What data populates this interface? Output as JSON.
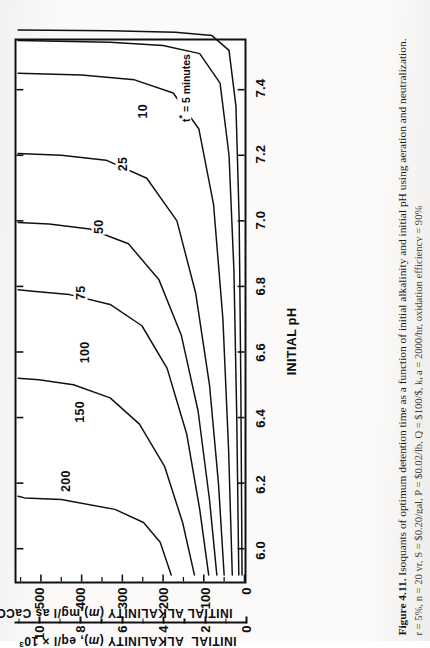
{
  "figure": {
    "number": "Figure 4.11.",
    "caption_line1": "Isoquants of optimum detention time as a function of initial alkalinity and initial pH using aeration and neutralization.",
    "caption_line2_prefix": "r = 5%, n = 20 yr, S = $0.20/gal, P = $0.02/lb, Q = $100/$, k",
    "caption_line2_sub": "L",
    "caption_line2_mid": "a = 2000/hr, oxidation efficiency = 90%"
  },
  "chart_data": {
    "type": "line",
    "title": "Isoquants of optimum detention time as a function of initial alkalinity and initial pH using aeration and neutralization.",
    "xlabel": "INITIAL pH",
    "ylabel": "INITIAL ALKALINITY (m),mg/l as CaCO3",
    "ylabel2": "INITIAL ALKALINITY (m), eq/l x 10^3",
    "xlim": [
      5.9,
      7.55
    ],
    "ylim": [
      0,
      560
    ],
    "ylim2": [
      0,
      11.2
    ],
    "grid": false,
    "legend": "none",
    "annotation": "t* = 5 minutes",
    "x_major_ticks": [
      "6.0",
      "6.2",
      "6.4",
      "6.6",
      "6.8",
      "7.0",
      "7.2",
      "7.4"
    ],
    "x_major_values": [
      6.0,
      6.2,
      6.4,
      6.6,
      6.8,
      7.0,
      7.2,
      7.4
    ],
    "y_major_ticks": [
      "0",
      "100",
      "200",
      "300",
      "400",
      "500"
    ],
    "y_major_values": [
      0,
      100,
      200,
      300,
      400,
      500
    ],
    "y_minor_values": [
      50,
      150,
      250,
      350,
      450,
      550
    ],
    "y2_major_ticks": [
      "0",
      "2",
      "4",
      "6",
      "8",
      "10"
    ],
    "y2_major_values": [
      0,
      2,
      4,
      6,
      8,
      10
    ],
    "y2_minor_values": [
      1,
      3,
      5,
      7,
      9,
      11
    ],
    "series": [
      {
        "name": "200",
        "label": "200",
        "label_x": 6.21,
        "label_y": 437,
        "points": [
          [
            5.92,
            180
          ],
          [
            6.02,
            207
          ],
          [
            6.08,
            248
          ],
          [
            6.12,
            318
          ],
          [
            6.15,
            450
          ],
          [
            6.155,
            540
          ],
          [
            6.16,
            556
          ]
        ]
      },
      {
        "name": "150",
        "label": "150",
        "label_x": 6.42,
        "label_y": 404,
        "points": [
          [
            5.92,
            123
          ],
          [
            6.08,
            152
          ],
          [
            6.25,
            196
          ],
          [
            6.38,
            258
          ],
          [
            6.46,
            330
          ],
          [
            6.5,
            420
          ],
          [
            6.515,
            505
          ],
          [
            6.52,
            556
          ]
        ]
      },
      {
        "name": "100",
        "label": "100",
        "label_x": 6.6,
        "label_y": 392,
        "points": [
          [
            5.92,
            88
          ],
          [
            6.12,
            110
          ],
          [
            6.35,
            142
          ],
          [
            6.55,
            190
          ],
          [
            6.68,
            252
          ],
          [
            6.745,
            330
          ],
          [
            6.775,
            430
          ],
          [
            6.785,
            520
          ],
          [
            6.79,
            556
          ]
        ]
      },
      {
        "name": "75",
        "label": "75",
        "label_x": 6.78,
        "label_y": 400,
        "points": [
          [
            5.92,
            68
          ],
          [
            6.15,
            86
          ],
          [
            6.42,
            114
          ],
          [
            6.65,
            155
          ],
          [
            6.82,
            210
          ],
          [
            6.93,
            285
          ],
          [
            6.975,
            380
          ],
          [
            6.99,
            480
          ],
          [
            6.995,
            556
          ]
        ]
      },
      {
        "name": "50",
        "label": "50",
        "label_x": 6.98,
        "label_y": 358,
        "points": [
          [
            5.92,
            50
          ],
          [
            6.2,
            64
          ],
          [
            6.5,
            86
          ],
          [
            6.78,
            120
          ],
          [
            7.0,
            166
          ],
          [
            7.13,
            240
          ],
          [
            7.185,
            340
          ],
          [
            7.2,
            450
          ],
          [
            7.205,
            556
          ]
        ]
      },
      {
        "name": "25",
        "label": "25",
        "label_x": 7.17,
        "label_y": 300,
        "points": [
          [
            5.92,
            30
          ],
          [
            6.3,
            39
          ],
          [
            6.7,
            53
          ],
          [
            7.05,
            76
          ],
          [
            7.28,
            112
          ],
          [
            7.39,
            175
          ],
          [
            7.43,
            270
          ],
          [
            7.445,
            400
          ],
          [
            7.45,
            556
          ]
        ]
      },
      {
        "name": "10",
        "label": "10",
        "label_x": 7.33,
        "label_y": 250,
        "points": [
          [
            5.92,
            14
          ],
          [
            6.4,
            19
          ],
          [
            6.85,
            26
          ],
          [
            7.2,
            38
          ],
          [
            7.42,
            60
          ],
          [
            7.51,
            110
          ],
          [
            7.535,
            200
          ],
          [
            7.545,
            330
          ],
          [
            7.55,
            556
          ]
        ]
      },
      {
        "name": "5",
        "label": "t* = 5 minutes",
        "label_x": 7.4,
        "label_y": 150,
        "points": [
          [
            5.92,
            6
          ],
          [
            6.5,
            9
          ],
          [
            7.0,
            13
          ],
          [
            7.35,
            21
          ],
          [
            7.52,
            38
          ],
          [
            7.565,
            80
          ],
          [
            7.575,
            170
          ],
          [
            7.58,
            330
          ],
          [
            7.582,
            556
          ]
        ]
      }
    ]
  }
}
